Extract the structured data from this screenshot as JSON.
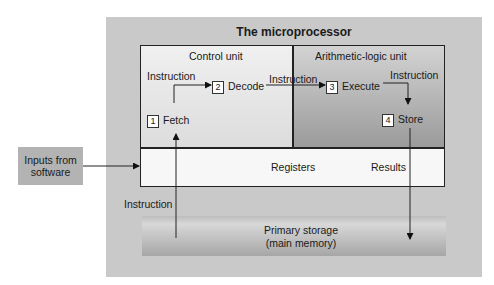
{
  "title": "The microprocessor",
  "control_unit": {
    "label": "Control unit",
    "instruction_label": "Instruction",
    "steps": [
      {
        "number": "1",
        "label": "Fetch"
      },
      {
        "number": "2",
        "label": "Decode"
      }
    ]
  },
  "alu": {
    "label": "Arithmetic-logic unit",
    "instruction_label_left": "Instruction",
    "instruction_label_right": "Instruction",
    "steps": [
      {
        "number": "3",
        "label": "Execute"
      },
      {
        "number": "4",
        "label": "Store"
      }
    ]
  },
  "registers": {
    "label": "Registers",
    "results_label": "Results"
  },
  "inputs": {
    "line1": "Inputs from",
    "line2": "software"
  },
  "bottom_instruction_label": "Instruction",
  "primary_storage": {
    "line1": "Primary storage",
    "line2": "(main memory)"
  }
}
